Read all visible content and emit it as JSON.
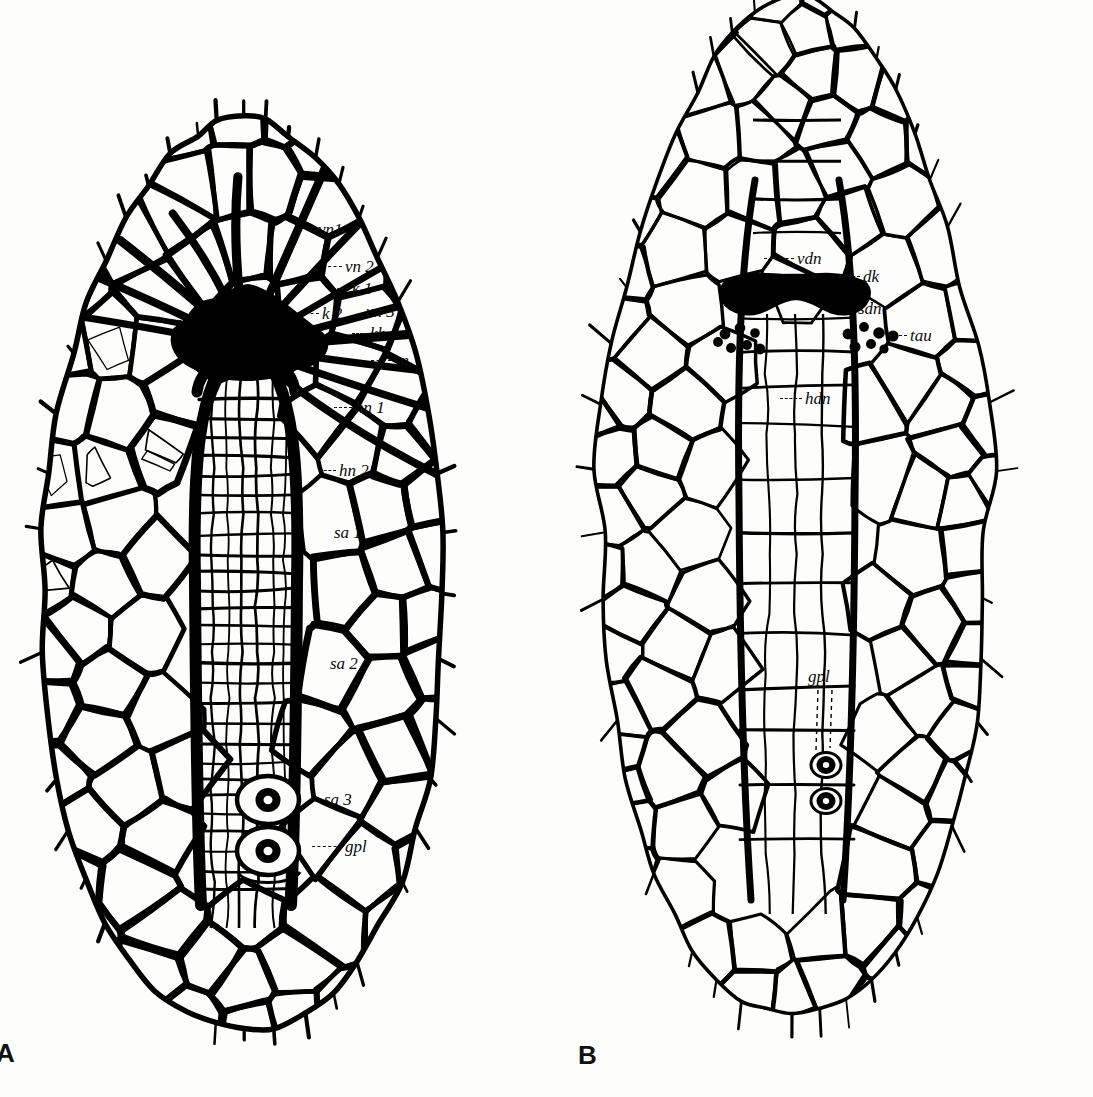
{
  "figure": {
    "background_color": "#fdfdfb",
    "ink_color": "#000000",
    "panels": [
      {
        "letter": "A",
        "name": "panel-a",
        "outline_shape": "ovoid",
        "line_weight": "heavy",
        "labels": [
          {
            "id": "vn1",
            "text": "vn1",
            "x": 318,
            "y": 221,
            "leader": false
          },
          {
            "id": "vn2",
            "text": "vn 2",
            "x": 345,
            "y": 258,
            "leader": true,
            "leader_len": 14
          },
          {
            "id": "k1",
            "text": "k 1",
            "x": 352,
            "y": 280,
            "leader": true,
            "leader_len": 16
          },
          {
            "id": "k2",
            "text": "k 2",
            "x": 322,
            "y": 305,
            "leader": true,
            "leader_len": 14
          },
          {
            "id": "vn3",
            "text": "vn 3",
            "x": 366,
            "y": 303,
            "leader": false
          },
          {
            "id": "kh",
            "text": "kh",
            "x": 370,
            "y": 325,
            "leader": true,
            "leader_len": 15
          },
          {
            "id": "sn",
            "text": "sn",
            "x": 394,
            "y": 352,
            "leader": true,
            "leader_len": 20
          },
          {
            "id": "hn1",
            "text": "hn 1",
            "x": 355,
            "y": 399,
            "leader": true,
            "leader_len": 18
          },
          {
            "id": "hn2",
            "text": "hn 2",
            "x": 339,
            "y": 462,
            "leader": true,
            "leader_len": 17
          },
          {
            "id": "sa1",
            "text": "sa 1",
            "x": 334,
            "y": 524,
            "leader": false
          },
          {
            "id": "sa2",
            "text": "sa 2",
            "x": 330,
            "y": 655,
            "leader": false
          },
          {
            "id": "sa3",
            "text": "sa 3",
            "x": 324,
            "y": 791,
            "leader": false
          },
          {
            "id": "gpl",
            "text": "gpl",
            "x": 345,
            "y": 838,
            "leader": true,
            "leader_len": 30
          }
        ]
      },
      {
        "letter": "B",
        "name": "panel-b",
        "outline_shape": "elongate-ovoid",
        "line_weight": "light",
        "labels": [
          {
            "id": "vdn",
            "text": "vdn",
            "x": 797,
            "y": 250,
            "leader": true,
            "leader_len": 30
          },
          {
            "id": "dk",
            "text": "dk",
            "x": 863,
            "y": 268,
            "leader": true,
            "leader_len": 22
          },
          {
            "id": "sdn",
            "text": "sdn",
            "x": 858,
            "y": 300,
            "leader": false
          },
          {
            "id": "tau",
            "text": "tau",
            "x": 910,
            "y": 327,
            "leader": true,
            "leader_len": 18
          },
          {
            "id": "hdn",
            "text": "hdn",
            "x": 805,
            "y": 390,
            "leader": true,
            "leader_len": 22
          },
          {
            "id": "gpl",
            "text": "gpl",
            "x": 808,
            "y": 668,
            "leader": false
          }
        ]
      }
    ],
    "abbreviations": {
      "vn1": "vn1",
      "vn2": "vn 2",
      "vn3": "vn 3",
      "k1": "k 1",
      "k2": "k 2",
      "kh": "kh",
      "sn": "sn",
      "hn1": "hn 1",
      "hn2": "hn 2",
      "sa1": "sa 1",
      "sa2": "sa 2",
      "sa3": "sa 3",
      "gpl": "gpl",
      "vdn": "vdn",
      "dk": "dk",
      "sdn": "sdn",
      "tau": "tau",
      "hdn": "hdn"
    },
    "features": {
      "panel_a_ocelli_count": 2,
      "panel_b_ocelli_count": 2,
      "panel_b_tuberclefield_left_dots": 7,
      "panel_b_tuberclefield_right_dots": 7,
      "panel_a_dark_wedge": "present",
      "panel_b_dark_band": "present"
    }
  }
}
